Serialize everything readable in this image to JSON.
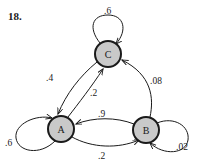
{
  "problem": {
    "number": "18."
  },
  "diagram": {
    "type": "markov-chain-state-diagram",
    "colors": {
      "node_fill": "#c9c9c9",
      "node_stroke": "#1a1a1a",
      "edge_stroke": "#1a1a1a",
      "text": "#1a1a1a",
      "background": "#ffffff"
    },
    "nodes": [
      {
        "id": "C",
        "label": "C",
        "cx": 108,
        "cy": 54,
        "r": 13
      },
      {
        "id": "A",
        "label": "A",
        "cx": 61,
        "cy": 129,
        "r": 13
      },
      {
        "id": "B",
        "label": "B",
        "cx": 146,
        "cy": 130,
        "r": 13
      }
    ],
    "edges": [
      {
        "id": "C-C",
        "from": "C",
        "to": "C",
        "label": ".6",
        "label_x": 104,
        "label_y": 14
      },
      {
        "id": "C-A",
        "from": "C",
        "to": "A",
        "label": ".4",
        "label_x": 46,
        "label_y": 81
      },
      {
        "id": "A-C",
        "from": "A",
        "to": "C",
        "label": ".2",
        "label_x": 90,
        "label_y": 96
      },
      {
        "id": "B-C",
        "from": "B",
        "to": "C",
        "label": ".08",
        "label_x": 150,
        "label_y": 84
      },
      {
        "id": "B-A",
        "from": "B",
        "to": "A",
        "label": ".9",
        "label_x": 98,
        "label_y": 117
      },
      {
        "id": "A-B",
        "from": "A",
        "to": "B",
        "label": ".2",
        "label_x": 98,
        "label_y": 159
      },
      {
        "id": "A-A",
        "from": "A",
        "to": "A",
        "label": ".6",
        "label_x": 5,
        "label_y": 146
      },
      {
        "id": "B-B",
        "from": "B",
        "to": "B",
        "label": ".02",
        "label_x": 176,
        "label_y": 150
      }
    ]
  }
}
